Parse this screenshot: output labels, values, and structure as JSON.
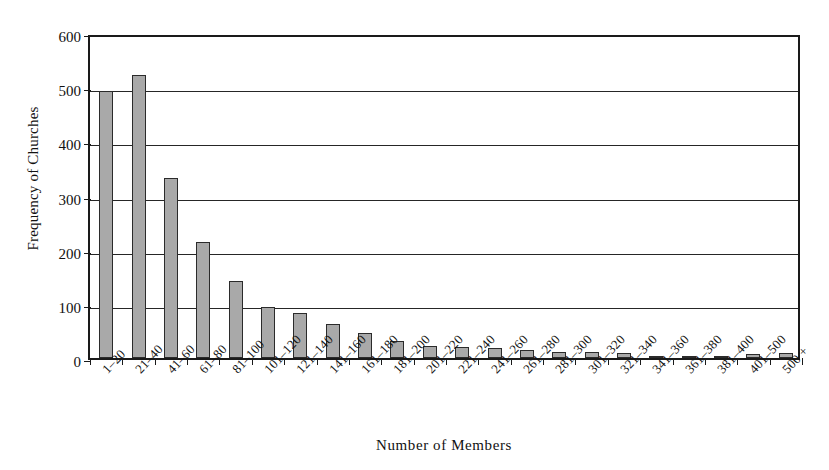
{
  "chart_data": {
    "type": "bar",
    "title": "",
    "xlabel": "Number of Members",
    "ylabel": "Frequency of Churches",
    "ylim": [
      0,
      600
    ],
    "yticks": [
      0,
      100,
      200,
      300,
      400,
      500,
      600
    ],
    "grid": true,
    "legend": "none",
    "bar_color": "#a9a9a9",
    "bar_edge_color": "#2b2b2b",
    "axis_color": "#1a1a1a",
    "categories": [
      "1–20",
      "21–40",
      "41–60",
      "61–80",
      "81–100",
      "101–120",
      "121–140",
      "141–160",
      "161–180",
      "181–200",
      "201–220",
      "221–240",
      "241–260",
      "261–280",
      "281–300",
      "301–320",
      "321–340",
      "341–360",
      "361–380",
      "381–400",
      "401–500",
      "500 +"
    ],
    "values": [
      493,
      522,
      333,
      215,
      143,
      94,
      83,
      63,
      47,
      31,
      23,
      21,
      19,
      14,
      12,
      11,
      10,
      4,
      3,
      3,
      7,
      10
    ]
  }
}
